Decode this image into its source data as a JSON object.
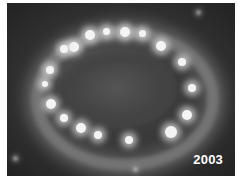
{
  "image": {
    "subject": "glowing elliptical ring of bright hotspots on dark background",
    "label": "2003",
    "colors": {
      "background": "#2c2c2c",
      "ring": "#aaaaaa",
      "hotspot": "#f4f4f4",
      "label": "#ffffff",
      "border": "#ffffff"
    }
  }
}
